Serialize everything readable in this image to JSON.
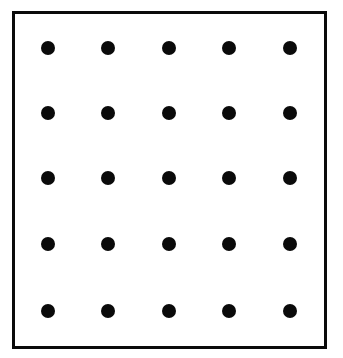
{
  "diagram": {
    "type": "dot-grid",
    "rows": 5,
    "columns": 5,
    "dot_count": 25,
    "frame_color": "#0a0a0a",
    "dot_color": "#0a0a0a",
    "background_color": "#ffffff",
    "column_x": [
      48,
      108,
      169,
      229,
      290
    ],
    "row_y": [
      48,
      113,
      178,
      244,
      311
    ]
  }
}
